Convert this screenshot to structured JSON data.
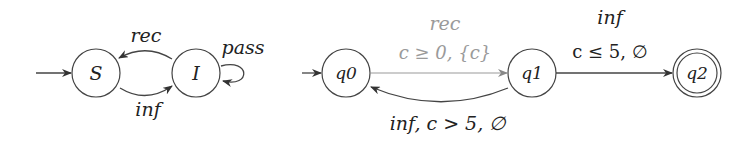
{
  "left_automaton": {
    "states": [
      {
        "id": "S",
        "label": "S",
        "initial": true
      },
      {
        "id": "I",
        "label": "I"
      }
    ],
    "transitions": [
      {
        "from": "I",
        "to": "S",
        "label": "rec"
      },
      {
        "from": "S",
        "to": "I",
        "label": "inf"
      },
      {
        "from": "I",
        "to": "I",
        "label": "pass"
      }
    ]
  },
  "right_automaton": {
    "states": [
      {
        "id": "q0",
        "label": "q0",
        "initial": true
      },
      {
        "id": "q1",
        "label": "q1"
      },
      {
        "id": "q2",
        "label": "q2",
        "accepting": true
      }
    ],
    "transitions": [
      {
        "from": "q0",
        "to": "q1",
        "action": "rec",
        "guard": "c ≥ 0, {c}",
        "color": "#9a9a9a"
      },
      {
        "from": "q1",
        "to": "q0",
        "label": "inf, c > 5, ∅"
      },
      {
        "from": "q1",
        "to": "q2",
        "action": "inf",
        "guard": "c ≤ 5, ∅"
      }
    ]
  }
}
